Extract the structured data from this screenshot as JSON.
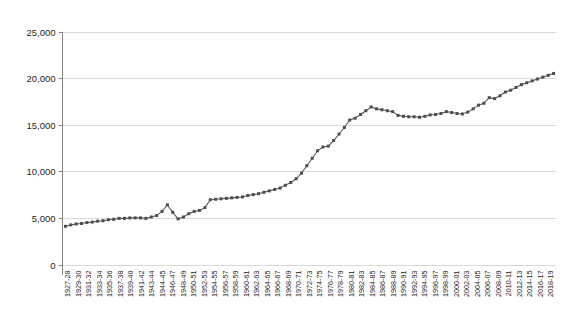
{
  "chart_data": {
    "type": "line",
    "title": "",
    "subtitle": "",
    "xlabel": "",
    "ylabel": "",
    "grid": true,
    "legend": false,
    "legend_position": "none",
    "marker": "square",
    "series_color": "#4d4d4d",
    "gridline_color": "#d9d9d9",
    "axis_color": "#808080",
    "ylim": [
      0,
      25000
    ],
    "ytick_labels": [
      "0",
      "5,000",
      "10,000",
      "15,000",
      "20,000",
      "25,000"
    ],
    "ytick_values": [
      0,
      5000,
      10000,
      15000,
      20000,
      25000
    ],
    "xtick_labels": [
      "1927-28",
      "1929-30",
      "1931-32",
      "1933-34",
      "1935-36",
      "1937-38",
      "1939-40",
      "1941-42",
      "1943-44",
      "1944-45",
      "1946-47",
      "1948-49",
      "1950-51",
      "1952-53",
      "1954-55",
      "1956-57",
      "1958-59",
      "1960-61",
      "1962-63",
      "1964-65",
      "1966-67",
      "1968-69",
      "1970-71",
      "1972-73",
      "1974-75",
      "1976-77",
      "1978-79",
      "1980-81",
      "1982-83",
      "1984-85",
      "1986-87",
      "1988-89",
      "1990-91",
      "1992-93",
      "1994-95",
      "1996-97",
      "1998-99",
      "2000-01",
      "2002-03",
      "2004-05",
      "2006-07",
      "2008-09",
      "2010-11",
      "2012-13",
      "2014-15",
      "2016-17",
      "2018-19"
    ],
    "categories": [
      "1927-28",
      "1928-29",
      "1929-30",
      "1930-31",
      "1931-32",
      "1932-33",
      "1933-34",
      "1934-35",
      "1935-36",
      "1936-37",
      "1937-38",
      "1938-39",
      "1939-40",
      "1940-41",
      "1941-42",
      "1942-43",
      "1943-44",
      "1944-45",
      "1945-46",
      "1946-47",
      "1947-48",
      "1948-49",
      "1949-50",
      "1950-51",
      "1951-52",
      "1952-53",
      "1953-54",
      "1954-55",
      "1955-56",
      "1956-57",
      "1957-58",
      "1958-59",
      "1959-60",
      "1960-61",
      "1961-62",
      "1962-63",
      "1963-64",
      "1964-65",
      "1965-66",
      "1966-67",
      "1967-68",
      "1968-69",
      "1969-70",
      "1970-71",
      "1971-72",
      "1972-73",
      "1973-74",
      "1974-75",
      "1975-76",
      "1976-77",
      "1977-78",
      "1978-79",
      "1979-80",
      "1980-81",
      "1981-82",
      "1982-83",
      "1983-84",
      "1984-85",
      "1985-86",
      "1986-87",
      "1987-88",
      "1988-89",
      "1989-90",
      "1990-91",
      "1991-92",
      "1992-93",
      "1993-94",
      "1994-95",
      "1995-96",
      "1996-97",
      "1997-98",
      "1998-99",
      "1999-00",
      "2000-01",
      "2001-02",
      "2002-03",
      "2003-04",
      "2004-05",
      "2005-06",
      "2006-07",
      "2007-08",
      "2008-09",
      "2009-10",
      "2010-11",
      "2011-12",
      "2012-13",
      "2013-14",
      "2014-15",
      "2015-16",
      "2016-17",
      "2017-18",
      "2018-19"
    ],
    "values": [
      4100,
      4250,
      4350,
      4400,
      4500,
      4550,
      4650,
      4700,
      4800,
      4850,
      4950,
      4950,
      5000,
      5000,
      5000,
      4950,
      5100,
      5250,
      5700,
      6400,
      5600,
      4900,
      5100,
      5450,
      5700,
      5800,
      6100,
      6950,
      7000,
      7050,
      7100,
      7150,
      7200,
      7250,
      7400,
      7500,
      7600,
      7750,
      7900,
      8050,
      8200,
      8500,
      8800,
      9200,
      9800,
      10600,
      11400,
      12200,
      12600,
      12700,
      13300,
      14000,
      14700,
      15500,
      15700,
      16100,
      16500,
      16900,
      16700,
      16600,
      16500,
      16400,
      16000,
      15900,
      15850,
      15850,
      15800,
      15900,
      16050,
      16100,
      16200,
      16400,
      16300,
      16200,
      16150,
      16350,
      16700,
      17100,
      17300,
      17900,
      17800,
      18100,
      18500,
      18700,
      19000,
      19300,
      19500,
      19700,
      19900,
      20100,
      20300,
      20500
    ]
  }
}
